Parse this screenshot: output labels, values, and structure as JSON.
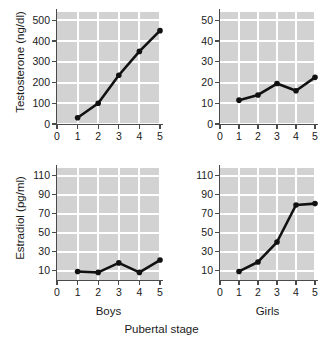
{
  "figure": {
    "xtitle": "Pubertal stage",
    "panel_labels": {
      "left": "Boys",
      "right": "Girls"
    }
  },
  "chart_data": [
    {
      "id": "boys-testosterone",
      "type": "line",
      "title": "",
      "group": "Boys",
      "xlabel": "Pubertal stage",
      "ylabel": "Testosterone (ng/dl)",
      "x": [
        1,
        2,
        3,
        4,
        5
      ],
      "values": [
        30,
        100,
        235,
        350,
        450
      ],
      "xlim": [
        0,
        5
      ],
      "ylim": [
        0,
        540
      ],
      "xticks": [
        0,
        1,
        2,
        3,
        4,
        5
      ],
      "yticks": [
        0,
        100,
        200,
        300,
        400,
        500
      ],
      "xticklabels": [
        "0",
        "1",
        "2",
        "3",
        "4",
        "5"
      ],
      "yticklabels": [
        "0",
        "100",
        "200",
        "300",
        "400",
        "500"
      ],
      "grid": true,
      "legend": "none",
      "marker": "filled-circle",
      "color": "#111111"
    },
    {
      "id": "girls-testosterone",
      "type": "line",
      "title": "",
      "group": "Girls",
      "xlabel": "Pubertal stage",
      "ylabel": "Testosterone (ng/dl)",
      "x": [
        1,
        2,
        3,
        4,
        5
      ],
      "values": [
        11.5,
        14,
        19.5,
        16,
        22.5
      ],
      "xlim": [
        0,
        5
      ],
      "ylim": [
        0,
        54
      ],
      "xticks": [
        0,
        1,
        2,
        3,
        4,
        5
      ],
      "yticks": [
        0,
        10,
        20,
        30,
        40,
        50
      ],
      "xticklabels": [
        "0",
        "1",
        "2",
        "3",
        "4",
        "5"
      ],
      "yticklabels": [
        "0",
        "10",
        "20",
        "30",
        "40",
        "50"
      ],
      "grid": true,
      "legend": "none",
      "marker": "filled-circle",
      "color": "#111111"
    },
    {
      "id": "boys-estradiol",
      "type": "line",
      "title": "",
      "group": "Boys",
      "xlabel": "Pubertal stage",
      "ylabel": "Estradiol (pg/ml)",
      "x": [
        1,
        2,
        3,
        4,
        5
      ],
      "values": [
        9,
        8,
        18,
        8,
        21
      ],
      "xlim": [
        0,
        5
      ],
      "ylim": [
        0,
        118
      ],
      "xticks": [
        0,
        1,
        2,
        3,
        4,
        5
      ],
      "yticks": [
        10,
        30,
        50,
        70,
        90,
        110
      ],
      "xticklabels": [
        "0",
        "1",
        "2",
        "3",
        "4",
        "5"
      ],
      "yticklabels": [
        "10",
        "30",
        "50",
        "70",
        "90",
        "110"
      ],
      "grid": true,
      "legend": "none",
      "marker": "filled-circle",
      "color": "#111111"
    },
    {
      "id": "girls-estradiol",
      "type": "line",
      "title": "",
      "group": "Girls",
      "xlabel": "Pubertal stage",
      "ylabel": "Estradiol (pg/ml)",
      "x": [
        1,
        2,
        3,
        4,
        5
      ],
      "values": [
        9,
        19,
        40,
        79,
        80.5
      ],
      "xlim": [
        0,
        5
      ],
      "ylim": [
        0,
        118
      ],
      "xticks": [
        0,
        1,
        2,
        3,
        4,
        5
      ],
      "yticks": [
        10,
        30,
        50,
        70,
        90,
        110
      ],
      "xticklabels": [
        "0",
        "1",
        "2",
        "3",
        "4",
        "5"
      ],
      "yticklabels": [
        "10",
        "30",
        "50",
        "70",
        "90",
        "110"
      ],
      "grid": true,
      "legend": "none",
      "marker": "filled-circle",
      "color": "#111111"
    }
  ],
  "axes": {
    "testosterone_title": "Testosterone (ng/dl)",
    "estradiol_title": "Estradiol (pg/ml)"
  },
  "colors": {
    "plot_background": "#d2d2d2",
    "gridline": "#ffffff",
    "series": "#111111",
    "axis": "#4a4a4a",
    "text": "#1a1a1a",
    "page_background": "#ffffff"
  }
}
